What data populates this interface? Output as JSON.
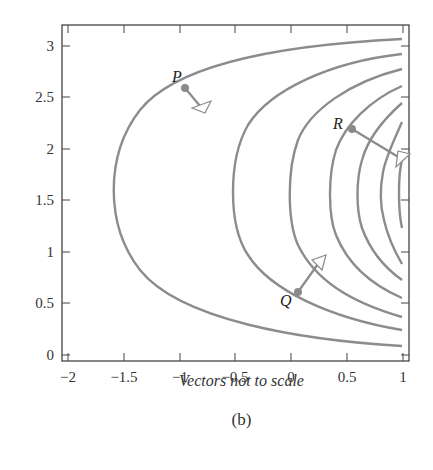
{
  "chart_data": {
    "type": "line",
    "title": "",
    "xlabel": "",
    "ylabel": "",
    "xlim": [
      -2,
      1
    ],
    "ylim": [
      0,
      3
    ],
    "x_ticks": [
      "-2",
      "-1.5",
      "-1",
      "-0.5",
      "0",
      "0.5",
      "1"
    ],
    "y_ticks": [
      "0",
      "0.5",
      "1",
      "1.5",
      "2",
      "2.5",
      "3"
    ],
    "grid": false,
    "legend": null,
    "series": [
      {
        "name": "level-curve-1",
        "vertex_x": -1.6,
        "top_end_y": 3.07,
        "bottom_end_y": 0.09
      },
      {
        "name": "level-curve-2",
        "vertex_x": -0.5,
        "top_end_y": 2.93,
        "bottom_end_y": 0.24
      },
      {
        "name": "level-curve-3",
        "vertex_x": 0.0,
        "top_end_y": 2.78,
        "bottom_end_y": 0.37
      },
      {
        "name": "level-curve-4",
        "vertex_x": 0.35,
        "top_end_y": 2.62,
        "bottom_end_y": 0.55
      },
      {
        "name": "level-curve-5",
        "vertex_x": 0.6,
        "top_end_y": 2.45,
        "bottom_end_y": 0.73
      },
      {
        "name": "level-curve-6",
        "vertex_x": 0.82,
        "top_end_y": 2.2,
        "bottom_end_y": 0.88
      },
      {
        "name": "level-curve-7",
        "vertex_x": 0.98,
        "top_end_y": 1.9,
        "bottom_end_y": 1.25
      }
    ],
    "points": [
      {
        "label": "P",
        "x": -0.93,
        "y": 2.6,
        "vector_to": [
          -0.83,
          2.44
        ]
      },
      {
        "label": "Q",
        "x": 0.05,
        "y": 0.6,
        "vector_to": [
          0.27,
          0.92
        ]
      },
      {
        "label": "R",
        "x": 0.55,
        "y": 2.2,
        "vector_to": [
          1.0,
          1.85
        ]
      }
    ],
    "annotations": [
      "Vectors not to scale",
      "(b)"
    ]
  },
  "captions": {
    "note": "Vectors not to scale",
    "panel": "(b)"
  },
  "axes": {
    "x_ticks": [
      {
        "label": "−2",
        "px": 68
      },
      {
        "label": "−1.5",
        "px": 124
      },
      {
        "label": "−1",
        "px": 180
      },
      {
        "label": "−0.5",
        "px": 235
      },
      {
        "label": "0",
        "px": 291
      },
      {
        "label": "0.5",
        "px": 347
      },
      {
        "label": "1",
        "px": 403
      }
    ],
    "y_ticks": [
      {
        "label": "0",
        "px": 355
      },
      {
        "label": "0.5",
        "px": 303
      },
      {
        "label": "1",
        "px": 252
      },
      {
        "label": "1.5",
        "px": 200
      },
      {
        "label": "2",
        "px": 149
      },
      {
        "label": "2.5",
        "px": 97
      },
      {
        "label": "3",
        "px": 46
      }
    ]
  },
  "colors": {
    "curve": "#8c8c8c",
    "axis": "#444444",
    "point": "#8a8a8a"
  }
}
